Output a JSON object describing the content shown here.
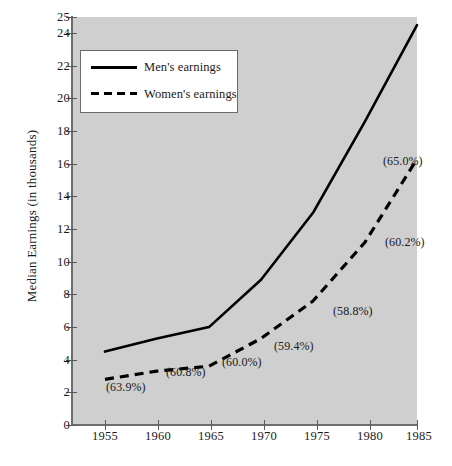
{
  "chart_data": {
    "type": "line",
    "title": "",
    "xlabel": "",
    "ylabel": "Median Earnings (in thousands)",
    "x": [
      1955,
      1960,
      1965,
      1970,
      1975,
      1980,
      1985
    ],
    "xticklabels": [
      "1955",
      "1960",
      "1965",
      "1970",
      "1975",
      "1980",
      "1985"
    ],
    "xlim": [
      1953,
      1985
    ],
    "ylim": [
      0,
      25
    ],
    "yticks": [
      0,
      2,
      4,
      6,
      8,
      10,
      12,
      14,
      16,
      18,
      20,
      22,
      24,
      25
    ],
    "yticklabels": [
      "0",
      "2",
      "4",
      "6",
      "8",
      "10",
      "12",
      "14",
      "16",
      "18",
      "20",
      "22",
      "24",
      "25"
    ],
    "grid": false,
    "legend_position": "upper-left-inside",
    "plot_background": "#cfcfcf",
    "series": [
      {
        "name": "Men's earnings",
        "style": "solid",
        "color": "#000000",
        "values": [
          4.5,
          5.3,
          6.0,
          8.9,
          13.0,
          18.6,
          24.5
        ]
      },
      {
        "name": "Women's earnings",
        "style": "dashed",
        "color": "#000000",
        "values": [
          2.8,
          3.3,
          3.6,
          5.3,
          7.6,
          11.2,
          16.3
        ]
      }
    ],
    "annotations": [
      {
        "text": "(63.9%)",
        "year": 1955
      },
      {
        "text": "(60.8%)",
        "year": 1960
      },
      {
        "text": "(60.0%)",
        "year": 1965
      },
      {
        "text": "(59.4%)",
        "year": 1970
      },
      {
        "text": "(58.8%)",
        "year": 1975
      },
      {
        "text": "(60.2%)",
        "year": 1980
      },
      {
        "text": "(65.0%)",
        "year": 1985
      }
    ]
  },
  "legend": {
    "items": [
      {
        "label": "Men's earnings",
        "style": "solid"
      },
      {
        "label": "Women's earnings",
        "style": "dashed"
      }
    ]
  },
  "axes": {
    "y_title": "Median Earnings (in thousands)",
    "y_labels": [
      "25",
      "24",
      "22",
      "20",
      "18",
      "16",
      "14",
      "12",
      "10",
      "8",
      "6",
      "4",
      "2",
      "0"
    ],
    "x_labels": [
      "1955",
      "1960",
      "1965",
      "1970",
      "1975",
      "1980",
      "1985"
    ]
  }
}
